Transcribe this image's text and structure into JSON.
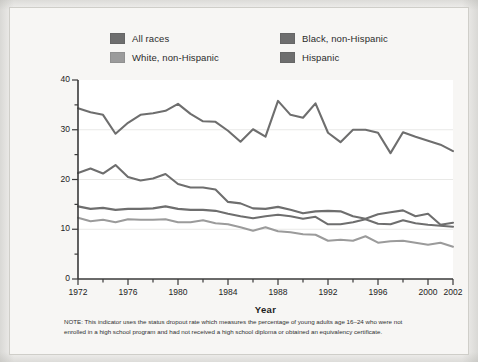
{
  "axes": {
    "ylabel": "Percent",
    "xlabel": "Year",
    "yticks": [
      "0",
      "10",
      "20",
      "30",
      "40"
    ],
    "xticks": [
      "1972",
      "1976",
      "1980",
      "1984",
      "1988",
      "1992",
      "1996",
      "2000",
      "2002"
    ]
  },
  "legend": {
    "items": [
      {
        "label": "All races",
        "color": "#6e6e6e"
      },
      {
        "label": "White, non-Hispanic",
        "color": "#9b9b9b"
      },
      {
        "label": "Black, non-Hispanic",
        "color": "#6e6e6e"
      },
      {
        "label": "Hispanic",
        "color": "#6e6e6e"
      }
    ]
  },
  "note": "NOTE: This indicator uses the status dropout rate which measures the percentage of young adults age 16–24 who were not enrolled in a high school program and had not received a high school diploma or obtained an equivalency certificate.",
  "chart_data": {
    "type": "line",
    "title": "",
    "xlabel": "Year",
    "ylabel": "Percent",
    "xlim": [
      1972,
      2002
    ],
    "ylim": [
      0,
      40
    ],
    "grid": "horizontal-major",
    "legend_position": "top",
    "x": [
      1972,
      1973,
      1974,
      1975,
      1976,
      1977,
      1978,
      1979,
      1980,
      1981,
      1982,
      1983,
      1984,
      1985,
      1986,
      1987,
      1988,
      1989,
      1990,
      1991,
      1992,
      1993,
      1994,
      1995,
      1996,
      1997,
      1998,
      1999,
      2000,
      2001,
      2002
    ],
    "series": [
      {
        "name": "All races",
        "color": "#6e6e6e",
        "values": [
          14.6,
          14.1,
          14.3,
          13.9,
          14.1,
          14.1,
          14.2,
          14.6,
          14.1,
          13.9,
          13.9,
          13.7,
          13.1,
          12.6,
          12.2,
          12.6,
          12.9,
          12.6,
          12.1,
          12.5,
          11.0,
          11.0,
          11.4,
          12.0,
          11.1,
          11.0,
          11.8,
          11.2,
          10.9,
          10.7,
          10.5
        ]
      },
      {
        "name": "White, non-Hispanic",
        "color": "#9b9b9b",
        "values": [
          12.3,
          11.6,
          11.9,
          11.4,
          12.0,
          11.9,
          11.9,
          12.0,
          11.4,
          11.4,
          11.8,
          11.2,
          11.0,
          10.4,
          9.7,
          10.4,
          9.6,
          9.4,
          9.0,
          8.9,
          7.7,
          7.9,
          7.7,
          8.6,
          7.3,
          7.6,
          7.7,
          7.3,
          6.9,
          7.3,
          6.5
        ]
      },
      {
        "name": "Black, non-Hispanic",
        "color": "#6e6e6e",
        "values": [
          21.3,
          22.2,
          21.2,
          22.9,
          20.5,
          19.8,
          20.2,
          21.1,
          19.1,
          18.4,
          18.4,
          18.0,
          15.5,
          15.2,
          14.2,
          14.1,
          14.5,
          13.9,
          13.2,
          13.6,
          13.7,
          13.6,
          12.6,
          12.1,
          13.0,
          13.4,
          13.8,
          12.6,
          13.1,
          10.9,
          11.3
        ]
      },
      {
        "name": "Hispanic",
        "color": "#6e6e6e",
        "values": [
          34.3,
          33.5,
          33.0,
          29.2,
          31.4,
          33.0,
          33.3,
          33.8,
          35.2,
          33.2,
          31.7,
          31.6,
          29.8,
          27.6,
          30.1,
          28.6,
          35.8,
          33.0,
          32.4,
          35.3,
          29.4,
          27.5,
          30.0,
          30.0,
          29.4,
          25.3,
          29.5,
          28.6,
          27.8,
          27.0,
          25.7
        ]
      }
    ]
  }
}
